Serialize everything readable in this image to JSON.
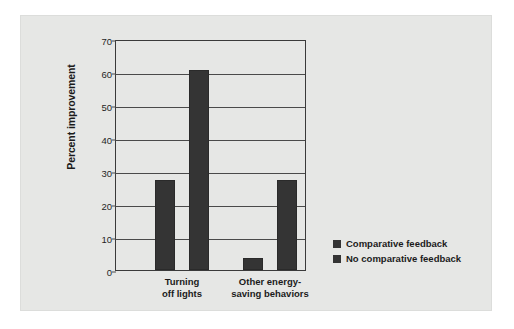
{
  "chart_data": {
    "type": "bar",
    "title": "",
    "xlabel": "",
    "ylabel": "Percent improvement",
    "ylim": [
      0,
      70
    ],
    "ytick_labels": [
      "70",
      "60",
      "50",
      "40",
      "30",
      "20",
      "10",
      "0"
    ],
    "ytick_values": [
      70,
      60,
      50,
      40,
      30,
      20,
      10,
      0
    ],
    "grid": true,
    "legend_position": "right-bottom",
    "categories": [
      "Turning off lights",
      "Other energy-saving behaviors"
    ],
    "category_lines": [
      [
        "Turning",
        "off lights"
      ],
      [
        "Other energy-",
        "saving behaviors"
      ]
    ],
    "series": [
      {
        "name": "Comparative feedback",
        "values": [
          27.3,
          3.6
        ],
        "color": "#343434"
      },
      {
        "name": "No comparative feedback",
        "values": [
          60.5,
          27.3
        ],
        "color": "#343434"
      }
    ]
  },
  "figure": {
    "panel_color": "#e6e7e5",
    "axis_color": "#3a3a3a",
    "bar_color": "#343434",
    "text_color": "#1b1b1b"
  },
  "legend": {
    "items": [
      {
        "label": "Comparative feedback",
        "color": "#343434"
      },
      {
        "label": "No comparative feedback",
        "color": "#343434"
      }
    ]
  }
}
